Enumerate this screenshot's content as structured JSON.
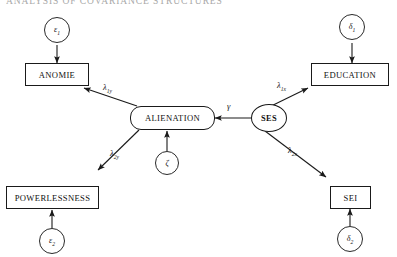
{
  "header": {
    "running_title": "ANALYSIS OF COVARIANCE STRUCTURES"
  },
  "diagram": {
    "type": "structural-equation-path-diagram",
    "latent_variables": [
      {
        "id": "alienation",
        "label": "ALIENATION",
        "shape": "rounded-rectangle"
      },
      {
        "id": "ses",
        "label": "SES",
        "shape": "ellipse"
      }
    ],
    "observed_variables": [
      {
        "id": "anomie",
        "label": "ANOMIE",
        "shape": "rectangle"
      },
      {
        "id": "powerlessness",
        "label": "POWERLESSNESS",
        "shape": "rectangle"
      },
      {
        "id": "education",
        "label": "EDUCATION",
        "shape": "rectangle"
      },
      {
        "id": "sei",
        "label": "SEI",
        "shape": "rectangle"
      }
    ],
    "disturbance_terms": [
      {
        "id": "eps1",
        "label": "ε",
        "sub": "1",
        "shape": "circle"
      },
      {
        "id": "eps2",
        "label": "ε",
        "sub": "2",
        "shape": "circle"
      },
      {
        "id": "delta1",
        "label": "δ",
        "sub": "1",
        "shape": "circle"
      },
      {
        "id": "delta2",
        "label": "δ",
        "sub": "2",
        "shape": "circle"
      },
      {
        "id": "zeta",
        "label": "ζ",
        "sub": "",
        "shape": "circle"
      }
    ],
    "path_labels": [
      {
        "id": "lambda1y",
        "label": "λ",
        "sub": "1y",
        "from": "alienation",
        "to": "anomie"
      },
      {
        "id": "lambda2y",
        "label": "λ",
        "sub": "2y",
        "from": "alienation",
        "to": "powerlessness"
      },
      {
        "id": "lambda1x",
        "label": "λ",
        "sub": "1x",
        "from": "ses",
        "to": "education"
      },
      {
        "id": "lambda2x",
        "label": "λ",
        "sub": "2x",
        "from": "ses",
        "to": "sei"
      },
      {
        "id": "gamma",
        "label": "γ",
        "sub": "",
        "from": "ses",
        "to": "alienation"
      }
    ]
  },
  "colors": {
    "stroke": "#1a1a1a",
    "background": "#ffffff",
    "header_text": "#9a9a9a"
  }
}
